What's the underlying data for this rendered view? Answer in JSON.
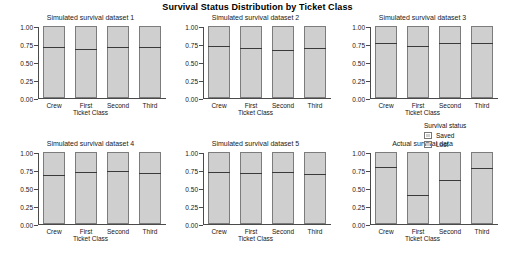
{
  "chart_data": {
    "type": "bar",
    "title": "Survival Status Distribution by Ticket Class",
    "xlabel": "Ticket Class",
    "ylabel": "",
    "ylim": [
      0,
      1
    ],
    "yticks": [
      "0.00",
      "0.25",
      "0.50",
      "0.75",
      "1.00"
    ],
    "ytick_values": [
      0,
      0.25,
      0.5,
      0.75,
      1
    ],
    "categories": [
      "Crew",
      "First",
      "Second",
      "Third"
    ],
    "grid": false,
    "stacked": true,
    "legend": {
      "title": "Survival status",
      "position": "right",
      "entries": [
        {
          "label": "Saved",
          "color": "#cfcfcf"
        },
        {
          "label": "Lost",
          "color": "#cfcfcf"
        }
      ]
    },
    "note": "Each bar is a stacked proportion bar totalling 1.00; the horizontal divider marks the Lost (lower) vs Saved (upper) split.",
    "panels": [
      {
        "title": "Simulated survival dataset 1",
        "series": [
          {
            "name": "Lost",
            "values": [
              0.685,
              0.655,
              0.68,
              0.68
            ]
          },
          {
            "name": "Saved",
            "values": [
              0.315,
              0.345,
              0.32,
              0.32
            ]
          }
        ]
      },
      {
        "title": "Simulated survival dataset 2",
        "series": [
          {
            "name": "Lost",
            "values": [
              0.7,
              0.665,
              0.645,
              0.67
            ]
          },
          {
            "name": "Saved",
            "values": [
              0.3,
              0.335,
              0.355,
              0.33
            ]
          }
        ]
      },
      {
        "title": "Simulated survival dataset 3",
        "series": [
          {
            "name": "Lost",
            "values": [
              0.73,
              0.69,
              0.73,
              0.735
            ]
          },
          {
            "name": "Saved",
            "values": [
              0.27,
              0.31,
              0.27,
              0.265
            ]
          }
        ]
      },
      {
        "title": "Simulated survival dataset 4",
        "series": [
          {
            "name": "Lost",
            "values": [
              0.655,
              0.695,
              0.71,
              0.675
            ]
          },
          {
            "name": "Saved",
            "values": [
              0.345,
              0.305,
              0.29,
              0.325
            ]
          }
        ]
      },
      {
        "title": "Simulated survival dataset 5",
        "series": [
          {
            "name": "Lost",
            "values": [
              0.7,
              0.675,
              0.695,
              0.665
            ]
          },
          {
            "name": "Saved",
            "values": [
              0.3,
              0.325,
              0.305,
              0.335
            ]
          }
        ]
      },
      {
        "title": "Actual survival data",
        "series": [
          {
            "name": "Lost",
            "values": [
              0.76,
              0.38,
              0.58,
              0.75
            ]
          },
          {
            "name": "Saved",
            "values": [
              0.24,
              0.62,
              0.42,
              0.25
            ]
          }
        ]
      }
    ]
  }
}
